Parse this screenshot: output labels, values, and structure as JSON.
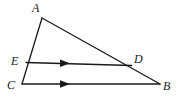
{
  "figure": {
    "type": "geometry-diagram",
    "background_color": "#ffffff",
    "stroke_color": "#1a1a1a",
    "label_color": "#1a1a1a",
    "canvas": {
      "width": 180,
      "height": 109
    },
    "points": [
      {
        "id": "A",
        "label": "A",
        "x": 42,
        "y": 18,
        "label_x": 32,
        "label_y": 2
      },
      {
        "id": "B",
        "label": "B",
        "x": 160,
        "y": 84,
        "label_x": 163,
        "label_y": 80
      },
      {
        "id": "C",
        "label": "C",
        "x": 22,
        "y": 84,
        "label_x": 7,
        "label_y": 79
      },
      {
        "id": "D",
        "label": "D",
        "x": 131,
        "y": 66,
        "label_x": 134,
        "label_y": 53
      },
      {
        "id": "E",
        "label": "E",
        "x": 26,
        "y": 62,
        "label_x": 11,
        "label_y": 55
      }
    ],
    "segments": [
      {
        "id": "AC",
        "from": "A",
        "to": "C",
        "marked_parallel": false
      },
      {
        "id": "AB",
        "from": "A",
        "to": "B",
        "marked_parallel": false
      },
      {
        "id": "CB",
        "from": "C",
        "to": "B",
        "marked_parallel": true
      },
      {
        "id": "ED",
        "from": "E",
        "to": "D",
        "marked_parallel": true
      }
    ],
    "arrow_markers": [
      {
        "on_segment": "ED",
        "x": 66,
        "y": 63,
        "direction": "right"
      },
      {
        "on_segment": "CB",
        "x": 66,
        "y": 84,
        "direction": "right"
      }
    ]
  }
}
